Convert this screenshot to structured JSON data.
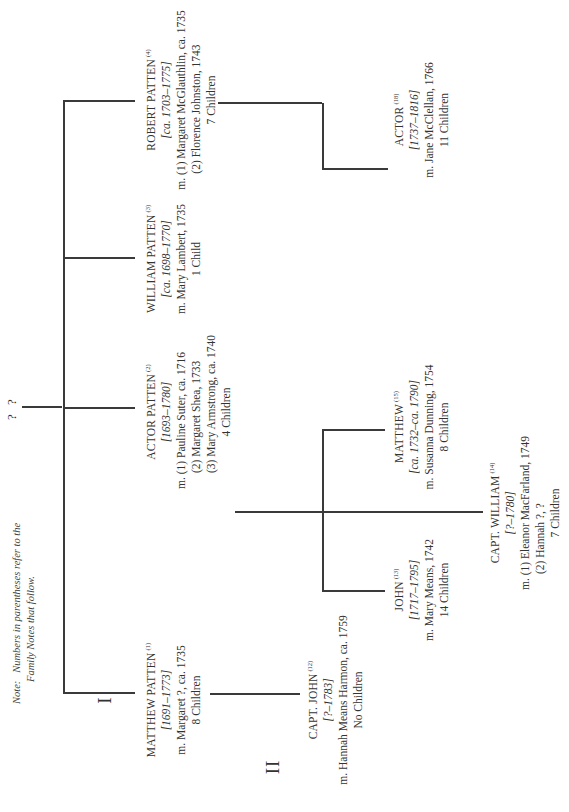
{
  "note": {
    "label": "Note:",
    "line1": "Numbers in parentheses refer to the",
    "line2": "Family Notes that follow."
  },
  "root": {
    "label": "? ?"
  },
  "generations": [
    {
      "label": "I"
    },
    {
      "label": "II"
    }
  ],
  "people": {
    "matthew_patten": {
      "name": "MATTHEW PATTEN",
      "ref": "(1)",
      "dates": "[1691–1773]",
      "marriages": [
        "m. Margaret ?, ca. 1735"
      ],
      "children": "8 Children"
    },
    "actor_patten": {
      "name": "ACTOR PATTEN",
      "ref": "(2)",
      "dates": "[1693–1780]",
      "marriages": [
        "m. (1) Pauline Suter, ca. 1716",
        "(2) Margaret Shea, 1733",
        "(3) Mary Armstrong, ca. 1740"
      ],
      "children": "4 Children"
    },
    "william_patten": {
      "name": "WILLIAM PATTEN",
      "ref": "(3)",
      "dates": "[ca. 1698–1770]",
      "marriages": [
        "m. Mary Lambert, 1735"
      ],
      "children": "1 Child"
    },
    "robert_patten": {
      "name": "ROBERT PATTEN",
      "ref": "(4)",
      "dates": "[ca. 1703–1775]",
      "marriages": [
        "m. (1) Margaret McGlauthlin, ca. 1735",
        "(2) Florence Johnston, 1743"
      ],
      "children": "7 Children"
    },
    "capt_john": {
      "name": "CAPT. JOHN",
      "ref": "(12)",
      "dates": "[?–1783]",
      "marriages": [
        "m. Hannah Means Harmon, ca. 1759"
      ],
      "children": "No Children"
    },
    "john": {
      "name": "JOHN",
      "ref": "(13)",
      "dates": "[1717–1795]",
      "marriages": [
        "m. Mary Means, 1742"
      ],
      "children": "14 Children"
    },
    "capt_william": {
      "name": "CAPT. WILLIAM",
      "ref": "(14)",
      "dates": "[?–1780]",
      "marriages": [
        "m. (1) Eleanor MacFarland, 1749",
        "(2) Hannah ?,  ?"
      ],
      "children": "7 Children"
    },
    "matthew": {
      "name": "MATTHEW",
      "ref": "(15)",
      "dates": "[ca. 1732–ca. 1790]",
      "marriages": [
        "m. Susanna Dunning, 1754"
      ],
      "children": "8 Children"
    },
    "actor": {
      "name": "ACTOR",
      "ref": "(18)",
      "dates": "[1737–1816]",
      "marriages": [
        "m. Jane McClellan, 1766"
      ],
      "children": "11 Children"
    }
  },
  "colors": {
    "line": "#3a3a3a",
    "text": "#333333",
    "background": "#ffffff"
  }
}
